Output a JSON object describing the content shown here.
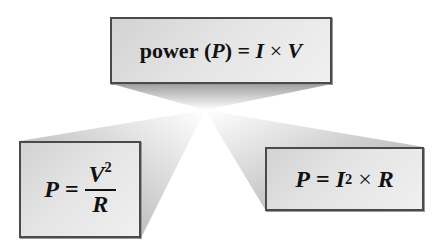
{
  "diagram": {
    "top_box": {
      "label": "power",
      "symbol": "P",
      "equals": "=",
      "term1": "I",
      "operator": "×",
      "term2": "V"
    },
    "left_box": {
      "lhs": "P",
      "equals": "=",
      "numerator_var": "V",
      "numerator_exp": "2",
      "denominator": "R"
    },
    "right_box": {
      "lhs": "P",
      "equals": "=",
      "term1": "I",
      "term1_exp": "2",
      "operator": "×",
      "term2": "R"
    },
    "colors": {
      "box_border": "#4a4a4a",
      "box_fill": "#e0e0e0",
      "ray_shade": "#b0b0b0",
      "text": "#111111",
      "background": "#ffffff"
    }
  }
}
